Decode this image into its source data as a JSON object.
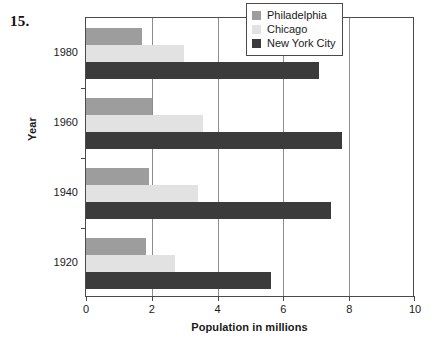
{
  "question_number": "15.",
  "chart_data": {
    "type": "bar",
    "orientation": "horizontal",
    "title": "",
    "xlabel": "Population in millions",
    "ylabel": "Year",
    "categories": [
      "1980",
      "1960",
      "1940",
      "1920"
    ],
    "series": [
      {
        "name": "Philadelphia",
        "color": "#9d9d9d",
        "values": [
          1.69,
          2.0,
          1.9,
          1.82
        ]
      },
      {
        "name": "Chicago",
        "color": "#e2e2e2",
        "values": [
          2.98,
          3.55,
          3.4,
          2.7
        ]
      },
      {
        "name": "New York City",
        "color": "#3b3b3b",
        "values": [
          7.07,
          7.78,
          7.45,
          5.62
        ]
      }
    ],
    "xlim": [
      0,
      10
    ],
    "xticks": [
      0,
      2,
      4,
      6,
      8,
      10
    ],
    "xtick_labels": [
      "0",
      "2",
      "4",
      "6",
      "8",
      "10"
    ],
    "grid": "vertical",
    "legend_position": "top-right"
  }
}
